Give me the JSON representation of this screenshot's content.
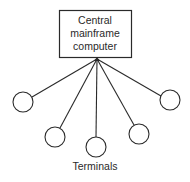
{
  "diagram": {
    "central_node": {
      "lines": [
        "Central",
        "mainframe",
        "computer"
      ]
    },
    "terminals_label": "Terminals",
    "terminal_count": 5,
    "colors": {
      "stroke": "#2a2a2a",
      "background": "#ffffff"
    }
  }
}
